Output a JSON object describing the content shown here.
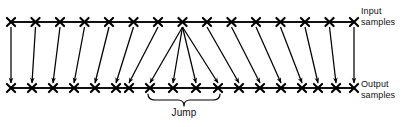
{
  "figure": {
    "background": "#ffffff",
    "ink": "#000000",
    "width": 408,
    "height": 127
  },
  "labels": {
    "input": "Input\nsamples",
    "output": "Output\nsamples",
    "jump": "Jump"
  },
  "rows": {
    "input": {
      "name": "input-sample-axis",
      "y": 22,
      "x_start": 11,
      "x_end": 354,
      "count": 15,
      "marker": "x-mark",
      "marker_positions": [
        11,
        35.5,
        60,
        84.5,
        109,
        133.5,
        158,
        182.5,
        207,
        231.5,
        256,
        280.5,
        305,
        329.5,
        354
      ]
    },
    "output": {
      "name": "output-sample-axis",
      "y": 88,
      "x_start": 11,
      "x_end": 354,
      "count": 18,
      "marker": "x-mark",
      "marker_positions": [
        11,
        32,
        53,
        74,
        95,
        116,
        129,
        150,
        173,
        196,
        218,
        239,
        260,
        281,
        302,
        318,
        336,
        354
      ]
    }
  },
  "arrows": {
    "name": "mapping-arrows",
    "description": "Arrows map each input sample to an output sample; the centre input sample fans out to four output samples spanning the jump.",
    "pairs": [
      {
        "x1": 11,
        "x2": 11
      },
      {
        "x1": 35.5,
        "x2": 32
      },
      {
        "x1": 60,
        "x2": 53
      },
      {
        "x1": 84.5,
        "x2": 74
      },
      {
        "x1": 109,
        "x2": 95
      },
      {
        "x1": 133.5,
        "x2": 116
      },
      {
        "x1": 158,
        "x2": 129
      },
      {
        "x1": 182.5,
        "x2": 150
      },
      {
        "x1": 182.5,
        "x2": 173
      },
      {
        "x1": 182.5,
        "x2": 196
      },
      {
        "x1": 182.5,
        "x2": 218
      },
      {
        "x1": 207,
        "x2": 239
      },
      {
        "x1": 231.5,
        "x2": 260
      },
      {
        "x1": 256,
        "x2": 281
      },
      {
        "x1": 280.5,
        "x2": 302
      },
      {
        "x1": 305,
        "x2": 318
      },
      {
        "x1": 329.5,
        "x2": 336
      },
      {
        "x1": 354,
        "x2": 354
      }
    ],
    "y_tail": 27,
    "y_head": 83
  },
  "jump_bracket": {
    "name": "jump-bracket",
    "x_left": 148,
    "x_right": 220,
    "y": 100,
    "depth": 6,
    "label": "Jump"
  }
}
